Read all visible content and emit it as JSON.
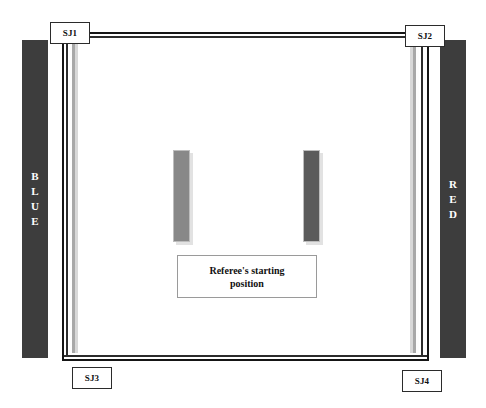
{
  "diagram": {
    "mat": {
      "surface_color": "#ffffff",
      "boundary_color": "#151515"
    },
    "corners": {
      "blue": {
        "label": "BLUE",
        "letters": [
          "B",
          "L",
          "U",
          "E"
        ],
        "color": "#3d3d3d",
        "text_color": "#ffffff"
      },
      "red": {
        "label": "RED",
        "letters": [
          "R",
          "E",
          "D"
        ],
        "color": "#3d3d3d",
        "text_color": "#ffffff"
      }
    },
    "judges": [
      {
        "id": "sj1",
        "label": "SJ1",
        "corner": "top-left"
      },
      {
        "id": "sj2",
        "label": "SJ2",
        "corner": "top-right"
      },
      {
        "id": "sj3",
        "label": "SJ3",
        "corner": "bottom-left"
      },
      {
        "id": "sj4",
        "label": "SJ4",
        "corner": "bottom-right"
      }
    ],
    "competitors": [
      {
        "id": "competitor-left",
        "color": "#888888"
      },
      {
        "id": "competitor-right",
        "color": "#5b5b5b"
      }
    ],
    "referee": {
      "line1": "Referee's starting",
      "line2": "position"
    }
  }
}
